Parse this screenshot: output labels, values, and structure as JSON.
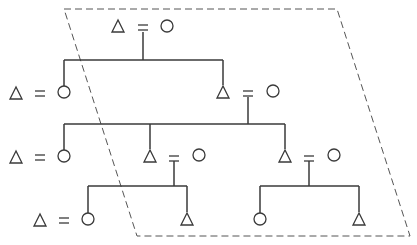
{
  "diagram": {
    "type": "kinship-diagram",
    "colors": {
      "line": "#3a3a3a",
      "dashed": "#555555",
      "background": "#ffffff"
    },
    "legend_symbols": {
      "male": "triangle",
      "female": "circle",
      "marriage": "equals-sign"
    },
    "boundary": {
      "style": "dashed",
      "points": [
        [
          64,
          9
        ],
        [
          337,
          9
        ],
        [
          410,
          236
        ],
        [
          137,
          236
        ]
      ]
    },
    "generations": [
      {
        "level": 1,
        "couples": [
          {
            "id": "g1-couple",
            "male_x": 118,
            "female_x": 167,
            "y": 27
          }
        ]
      },
      {
        "level": 2,
        "couples": [
          {
            "id": "g2-left-couple",
            "male_x": 16,
            "female_x": 64,
            "y": 93
          },
          {
            "id": "g2-right-couple",
            "male_x": 223,
            "female_x": 273,
            "y": 93
          }
        ]
      },
      {
        "level": 3,
        "couples": [
          {
            "id": "g3-left-couple",
            "male_x": 16,
            "female_x": 64,
            "y": 157
          },
          {
            "id": "g3-middle-couple",
            "male_x": 150,
            "female_x": 199,
            "y": 157
          },
          {
            "id": "g3-right-couple",
            "male_x": 285,
            "female_x": 334,
            "y": 157
          }
        ]
      },
      {
        "level": 4,
        "couples": [
          {
            "id": "g4-left-couple",
            "male_x": 40,
            "female_x": 88,
            "y": 220
          }
        ],
        "singles": [
          {
            "id": "g4-male-a",
            "sex": "male",
            "x": 187,
            "y": 220
          },
          {
            "id": "g4-female-b",
            "sex": "female",
            "x": 260,
            "y": 220
          },
          {
            "id": "g4-male-c",
            "sex": "male",
            "x": 359,
            "y": 220
          }
        ]
      }
    ]
  }
}
